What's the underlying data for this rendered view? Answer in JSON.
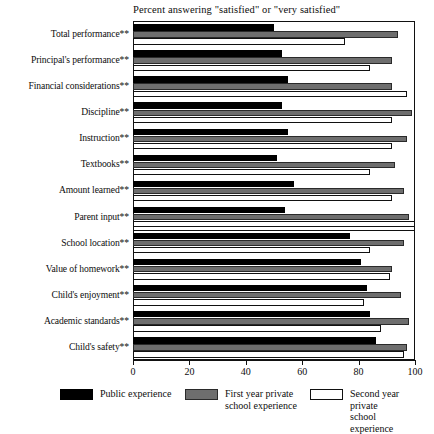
{
  "chart_data": {
    "type": "bar",
    "orientation": "horizontal",
    "title": "Percent answering \"satisfied\" or \"very satisfied\"",
    "xlabel": "",
    "ylabel": "",
    "xlim": [
      0,
      100
    ],
    "xticks": [
      0,
      20,
      40,
      60,
      80,
      100
    ],
    "xtick_labels": [
      "0",
      "20",
      "40",
      "60",
      "80",
      "100"
    ],
    "grid": false,
    "legend_position": "bottom",
    "categories": [
      "Total performance**",
      "Principal's performance**",
      "Financial considerations**",
      "Discipline**",
      "Instruction**",
      "Textbooks**",
      "Amount learned**",
      "Parent input**",
      "School location**",
      "Value of homework**",
      "Child's enjoyment**",
      "Academic standards**",
      "Child's safety**"
    ],
    "series": [
      {
        "name": "Public experience",
        "color": "#000000",
        "values": [
          50,
          53,
          55,
          53,
          55,
          51,
          57,
          54,
          77,
          81,
          83,
          84,
          86
        ]
      },
      {
        "name": "First year private school experience",
        "color": "#6e6e6e",
        "values": [
          94,
          92,
          92,
          99,
          97,
          93,
          96,
          98,
          96,
          92,
          95,
          98,
          97
        ]
      },
      {
        "name": "Second year private school experience",
        "color": "#ffffff",
        "values": [
          75,
          84,
          97,
          92,
          92,
          84,
          92,
          100,
          84,
          91,
          82,
          88,
          96
        ]
      }
    ],
    "group_break_after_index": 7
  },
  "legend": {
    "items": [
      {
        "label": "Public experience",
        "swatch": "public"
      },
      {
        "label": "First year private\nschool experience",
        "swatch": "first"
      },
      {
        "label": "Second year private\nschool experience",
        "swatch": "second"
      }
    ]
  }
}
